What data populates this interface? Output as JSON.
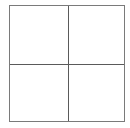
{
  "diagram": {
    "type": "grid",
    "rows": 2,
    "columns": 2,
    "cells": [
      {
        "row": 0,
        "col": 0,
        "label": ""
      },
      {
        "row": 0,
        "col": 1,
        "label": ""
      },
      {
        "row": 1,
        "col": 0,
        "label": ""
      },
      {
        "row": 1,
        "col": 1,
        "label": ""
      }
    ],
    "line_color": "#5a5a5a",
    "background": "#ffffff"
  }
}
